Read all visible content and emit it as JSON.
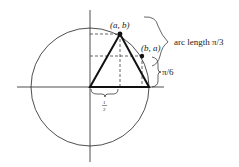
{
  "diagram": {
    "labels": {
      "point_ab": "(a, b)",
      "point_ba": "(b, a)",
      "arc": "arc length π/3",
      "angle": "π/6",
      "half_num": "1",
      "half_den": "2"
    },
    "colors": {
      "line": "#222222",
      "background": "#ffffff"
    }
  }
}
